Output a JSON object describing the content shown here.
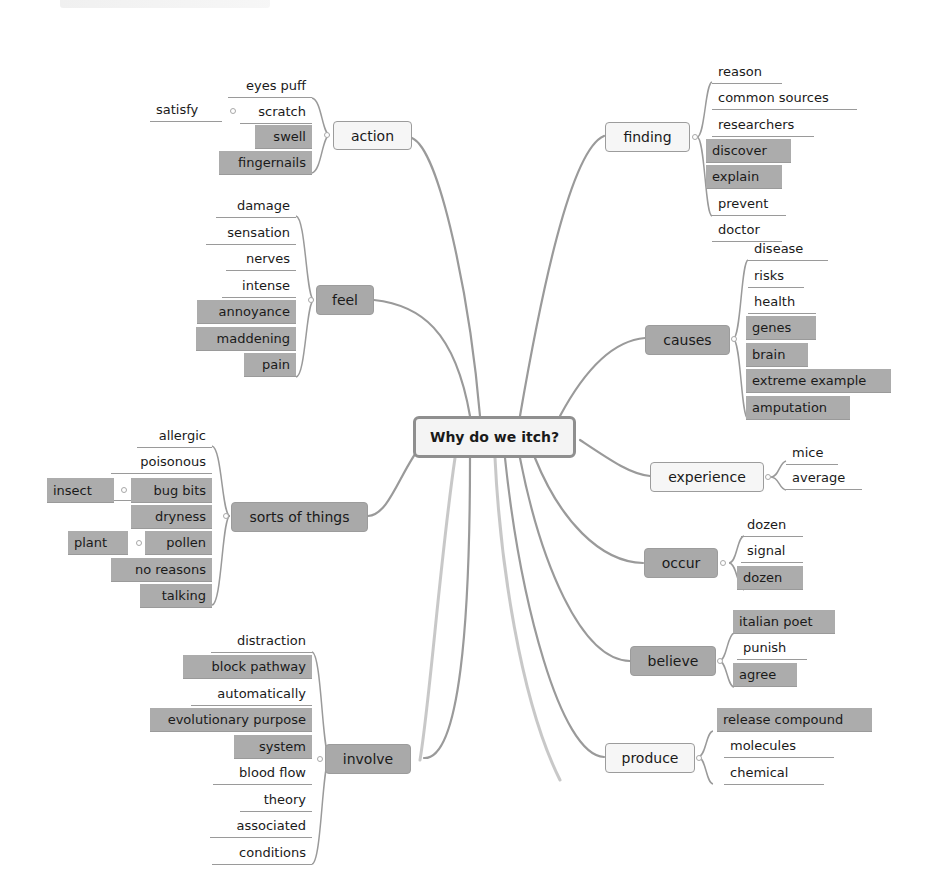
{
  "central": {
    "label": "Why do we itch?"
  },
  "branches": {
    "action": {
      "label": "action",
      "style": "light",
      "leaves": [
        {
          "label": "eyes puff",
          "hl": false
        },
        {
          "label": "scratch",
          "hl": false,
          "child": "satisfy"
        },
        {
          "label": "swell",
          "hl": true
        },
        {
          "label": "fingernails",
          "hl": true
        }
      ]
    },
    "feel": {
      "label": "feel",
      "style": "dark",
      "leaves": [
        {
          "label": "damage",
          "hl": false
        },
        {
          "label": "sensation",
          "hl": false
        },
        {
          "label": "nerves",
          "hl": false
        },
        {
          "label": "intense",
          "hl": false
        },
        {
          "label": "annoyance",
          "hl": true
        },
        {
          "label": "maddening",
          "hl": true
        },
        {
          "label": "pain",
          "hl": true
        }
      ]
    },
    "sorts": {
      "label": "sorts of things",
      "style": "dark",
      "leaves": [
        {
          "label": "allergic",
          "hl": false
        },
        {
          "label": "poisonous",
          "hl": false
        },
        {
          "label": "mysterious",
          "hl": false
        },
        {
          "label": "bug bits",
          "hl": true,
          "child": "insect"
        },
        {
          "label": "dryness",
          "hl": true
        },
        {
          "label": "pollen",
          "hl": true,
          "child": "plant"
        },
        {
          "label": "no reasons",
          "hl": true
        },
        {
          "label": "talking",
          "hl": true
        }
      ]
    },
    "involve": {
      "label": "involve",
      "style": "dark",
      "leaves": [
        {
          "label": "distraction",
          "hl": false
        },
        {
          "label": "block pathway",
          "hl": true
        },
        {
          "label": "automatically",
          "hl": false
        },
        {
          "label": "evolutionary purpose",
          "hl": true
        },
        {
          "label": "system",
          "hl": true
        },
        {
          "label": "blood flow",
          "hl": false
        },
        {
          "label": "theory",
          "hl": false
        },
        {
          "label": "associated",
          "hl": false
        },
        {
          "label": "conditions",
          "hl": false
        }
      ]
    },
    "finding": {
      "label": "finding",
      "style": "light",
      "leaves": [
        {
          "label": "reason",
          "hl": false
        },
        {
          "label": "common sources",
          "hl": false
        },
        {
          "label": "researchers",
          "hl": false
        },
        {
          "label": "discover",
          "hl": true
        },
        {
          "label": "explain",
          "hl": true
        },
        {
          "label": "prevent",
          "hl": false
        },
        {
          "label": "doctor",
          "hl": false
        }
      ]
    },
    "causes": {
      "label": "causes",
      "style": "dark",
      "leaves": [
        {
          "label": "disease",
          "hl": false
        },
        {
          "label": "risks",
          "hl": false
        },
        {
          "label": "health",
          "hl": false
        },
        {
          "label": "genes",
          "hl": true
        },
        {
          "label": "brain",
          "hl": true
        },
        {
          "label": "extreme example",
          "hl": true
        },
        {
          "label": "amputation",
          "hl": true
        }
      ]
    },
    "experience": {
      "label": "experience",
      "style": "light",
      "leaves": [
        {
          "label": "mice",
          "hl": false
        },
        {
          "label": "average",
          "hl": false
        }
      ]
    },
    "occur": {
      "label": "occur",
      "style": "dark",
      "leaves": [
        {
          "label": "dozen",
          "hl": false
        },
        {
          "label": "signal",
          "hl": false
        },
        {
          "label": "dozen",
          "hl": true
        }
      ]
    },
    "believe": {
      "label": "believe",
      "style": "dark",
      "leaves": [
        {
          "label": "italian poet",
          "hl": true
        },
        {
          "label": "punish",
          "hl": false
        },
        {
          "label": "agree",
          "hl": true
        }
      ]
    },
    "produce": {
      "label": "produce",
      "style": "light",
      "leaves": [
        {
          "label": "release compound",
          "hl": true
        },
        {
          "label": "molecules",
          "hl": false
        },
        {
          "label": "chemical",
          "hl": false
        }
      ]
    }
  },
  "colors": {
    "line": "#9a9a9a",
    "highlight_fill": "#acacac",
    "dark_branch_fill": "#a9a9a9",
    "light_branch_fill": "#f6f6f6",
    "central_border": "#8f8f8f"
  }
}
